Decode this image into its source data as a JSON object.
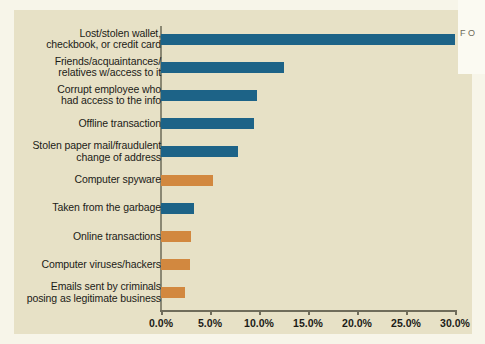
{
  "colors": {
    "panel_background": "#e7e1c6",
    "page_background": "#f7f5e9",
    "bar_blue": "#1d6387",
    "bar_orange": "#d2883f",
    "axis": "#6f6c5a",
    "text": "#1b1b17"
  },
  "page_corner": {
    "text": "F\nO"
  },
  "chart_data": {
    "type": "bar",
    "orientation": "horizontal",
    "title": "",
    "subtitle": "",
    "xlabel": "",
    "ylabel": "",
    "xlim": [
      0,
      30
    ],
    "grid": false,
    "legend": "none",
    "tick_labels": [
      "0.0%",
      "5.0%",
      "10.0%",
      "15.0%",
      "20.0%",
      "25.0%",
      "30.0%"
    ],
    "tick_values": [
      0,
      5,
      10,
      15,
      20,
      25,
      30
    ],
    "categories": [
      "Lost/stolen wallet,\ncheckbook, or credit card",
      "Friends/acquaintances/\nrelatives w/access to it",
      "Corrupt employee who\nhad access to the info",
      "Offline transaction",
      "Stolen paper mail/fraudulent\nchange of address",
      "Computer spyware",
      "Taken from the garbage",
      "Online transactions",
      "Computer viruses/hackers",
      "Emails sent by criminals\nposing as legitimate business"
    ],
    "values": [
      30.0,
      12.5,
      9.8,
      9.5,
      7.9,
      5.3,
      3.4,
      3.1,
      3.0,
      2.4
    ],
    "bar_colors": [
      "#1d6387",
      "#1d6387",
      "#1d6387",
      "#1d6387",
      "#1d6387",
      "#d2883f",
      "#1d6387",
      "#d2883f",
      "#d2883f",
      "#d2883f"
    ]
  }
}
